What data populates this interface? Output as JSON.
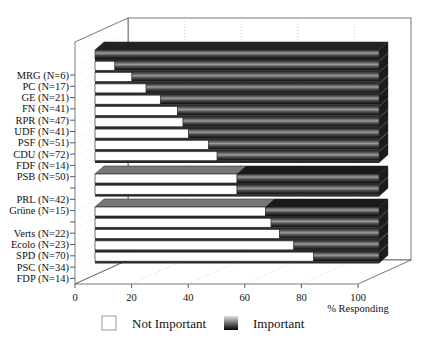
{
  "chart_data": {
    "type": "bar",
    "orientation": "horizontal",
    "stacked": true,
    "three_d": true,
    "title": "",
    "xlabel": "% Responding",
    "ylabel": "",
    "xlim": [
      0,
      100
    ],
    "xticks": [
      "0",
      "20",
      "40",
      "60",
      "80",
      "100"
    ],
    "grid": true,
    "legend_position": "bottom",
    "groups": [
      [
        "MRG (N=6)",
        "PC (N=17)",
        "GE (N=21)",
        "FN (N=41)",
        "RPR (N=47)",
        "UDF (N=41)",
        "PSF (N=51)",
        "CDU (N=72)",
        "FDF (N=14)",
        "PSB (N=50)"
      ],
      [
        "PRL (N=42)",
        "Grüne (N=15)"
      ],
      [
        "Verts (N=22)",
        "Ecolo (N=23)",
        "SPD (N=70)",
        "PSC (N=34)",
        "FDP (N=14)"
      ]
    ],
    "categories": [
      "MRG (N=6)",
      "PC (N=17)",
      "GE (N=21)",
      "FN (N=41)",
      "RPR (N=47)",
      "UDF (N=41)",
      "PSF (N=51)",
      "CDU (N=72)",
      "FDF (N=14)",
      "PSB (N=50)",
      "PRL (N=42)",
      "Grüne (N=15)",
      "Verts (N=22)",
      "Ecolo (N=23)",
      "SPD (N=70)",
      "PSC (N=34)",
      "FDP (N=14)"
    ],
    "series": [
      {
        "name": "Not Important",
        "color": "#ffffff",
        "values": [
          0,
          7,
          13,
          18,
          23,
          29,
          31,
          33,
          40,
          43,
          50,
          50,
          60,
          62,
          65,
          70,
          77
        ]
      },
      {
        "name": "Important",
        "color": "#2a2a2a",
        "values": [
          100,
          93,
          87,
          82,
          77,
          71,
          69,
          67,
          60,
          57,
          50,
          50,
          40,
          38,
          35,
          30,
          23
        ]
      }
    ]
  },
  "legend": {
    "not_important": "Not Important",
    "important": "Important"
  },
  "axis": {
    "xlabel": "% Responding"
  }
}
